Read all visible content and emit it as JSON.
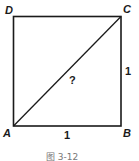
{
  "figure": {
    "caption": "图 3-12",
    "vertices": {
      "A": {
        "label": "A"
      },
      "B": {
        "label": "B"
      },
      "C": {
        "label": "C"
      },
      "D": {
        "label": "D"
      }
    },
    "side_labels": {
      "AB": "1",
      "BC": "1"
    },
    "diagonal_label": "?",
    "stroke_color": "#1a1a1a"
  }
}
